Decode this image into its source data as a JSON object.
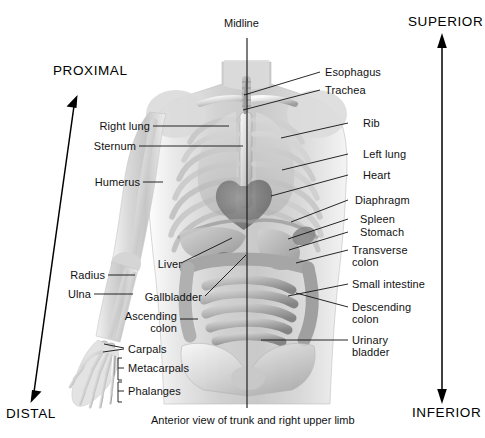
{
  "figure": {
    "title": "Anterior view of trunk and right upper limb",
    "midline_label": "Midline",
    "background_color": "#ffffff",
    "ink_color": "#111111"
  },
  "direction_arrows": [
    {
      "label": "SUPERIOR",
      "direction": "up",
      "axis": "vertical-right"
    },
    {
      "label": "INFERIOR",
      "direction": "down",
      "axis": "vertical-right"
    },
    {
      "label": "PROXIMAL",
      "direction": "up-right",
      "axis": "diagonal-left"
    },
    {
      "label": "DISTAL",
      "direction": "down-left",
      "axis": "diagonal-left"
    }
  ],
  "labels_left": [
    {
      "text": "Right lung",
      "line2": ""
    },
    {
      "text": "Sternum",
      "line2": ""
    },
    {
      "text": "Humerus",
      "line2": ""
    },
    {
      "text": "Liver",
      "line2": ""
    },
    {
      "text": "Radius",
      "line2": ""
    },
    {
      "text": "Ulna",
      "line2": ""
    },
    {
      "text": "Gallbladder",
      "line2": ""
    },
    {
      "text": "Ascending",
      "line2": "colon"
    },
    {
      "text": "Carpals",
      "line2": ""
    },
    {
      "text": "Metacarpals",
      "line2": ""
    },
    {
      "text": "Phalanges",
      "line2": ""
    }
  ],
  "labels_right": [
    {
      "text": "Esophagus",
      "line2": ""
    },
    {
      "text": "Trachea",
      "line2": ""
    },
    {
      "text": "Rib",
      "line2": ""
    },
    {
      "text": "Left lung",
      "line2": ""
    },
    {
      "text": "Heart",
      "line2": ""
    },
    {
      "text": "Diaphragm",
      "line2": ""
    },
    {
      "text": "Spleen",
      "line2": ""
    },
    {
      "text": "Stomach",
      "line2": ""
    },
    {
      "text": "Transverse",
      "line2": "colon"
    },
    {
      "text": "Small intestine",
      "line2": ""
    },
    {
      "text": "Descending",
      "line2": "colon"
    },
    {
      "text": "Urinary",
      "line2": "bladder"
    }
  ]
}
